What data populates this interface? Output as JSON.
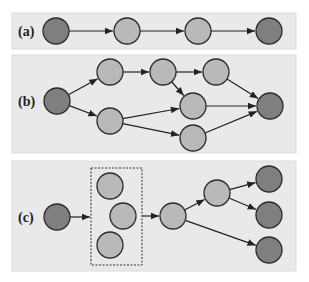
{
  "figure": {
    "panels": [
      {
        "id": "a",
        "label": "(a)",
        "nodes": [
          {
            "id": "a1",
            "type": "dark",
            "x": 56,
            "y": 31
          },
          {
            "id": "a2",
            "type": "light",
            "x": 127,
            "y": 31
          },
          {
            "id": "a3",
            "type": "light",
            "x": 198,
            "y": 31
          },
          {
            "id": "a4",
            "type": "dark",
            "x": 269,
            "y": 31
          }
        ],
        "edges": [
          [
            "a1",
            "a2"
          ],
          [
            "a2",
            "a3"
          ],
          [
            "a3",
            "a4"
          ]
        ]
      },
      {
        "id": "b",
        "label": "(b)",
        "nodes": [
          {
            "id": "b1",
            "type": "dark",
            "x": 57,
            "y": 101
          },
          {
            "id": "b2",
            "type": "light",
            "x": 110,
            "y": 72
          },
          {
            "id": "b3",
            "type": "light",
            "x": 110,
            "y": 121
          },
          {
            "id": "b4",
            "type": "light",
            "x": 163,
            "y": 72
          },
          {
            "id": "b5",
            "type": "light",
            "x": 216,
            "y": 72
          },
          {
            "id": "b6",
            "type": "light",
            "x": 193,
            "y": 106
          },
          {
            "id": "b7",
            "type": "light",
            "x": 193,
            "y": 138
          },
          {
            "id": "b8",
            "type": "dark",
            "x": 270,
            "y": 106
          }
        ],
        "edges": [
          [
            "b1",
            "b2"
          ],
          [
            "b1",
            "b3"
          ],
          [
            "b2",
            "b4"
          ],
          [
            "b4",
            "b5"
          ],
          [
            "b4",
            "b6"
          ],
          [
            "b3",
            "b6"
          ],
          [
            "b3",
            "b7"
          ],
          [
            "b5",
            "b8"
          ],
          [
            "b6",
            "b8"
          ],
          [
            "b7",
            "b8"
          ]
        ]
      },
      {
        "id": "c",
        "label": "(c)",
        "nodes": [
          {
            "id": "c1",
            "type": "dark",
            "x": 57,
            "y": 217
          },
          {
            "id": "c2",
            "type": "light",
            "x": 110,
            "y": 186
          },
          {
            "id": "c3",
            "type": "light",
            "x": 123,
            "y": 216
          },
          {
            "id": "c4",
            "type": "light",
            "x": 110,
            "y": 245
          },
          {
            "id": "c5",
            "type": "light",
            "x": 173,
            "y": 216
          },
          {
            "id": "c6",
            "type": "light",
            "x": 217,
            "y": 193
          },
          {
            "id": "c7",
            "type": "dark",
            "x": 269,
            "y": 179
          },
          {
            "id": "c8",
            "type": "dark",
            "x": 269,
            "y": 215
          },
          {
            "id": "c9",
            "type": "dark",
            "x": 269,
            "y": 250
          }
        ],
        "group": {
          "x": 91,
          "y": 168,
          "w": 51,
          "h": 97,
          "style": "dotted"
        },
        "edges": [
          [
            "c1",
            "group"
          ],
          [
            "group",
            "c5"
          ],
          [
            "c5",
            "c6"
          ],
          [
            "c6",
            "c7"
          ],
          [
            "c6",
            "c8"
          ],
          [
            "c5",
            "c9"
          ]
        ]
      }
    ],
    "colors": {
      "dark_node": "#7f7f7f",
      "light_node": "#b9b9b9",
      "panel_bg": "#e9e9e9",
      "edge": "#222222"
    }
  }
}
